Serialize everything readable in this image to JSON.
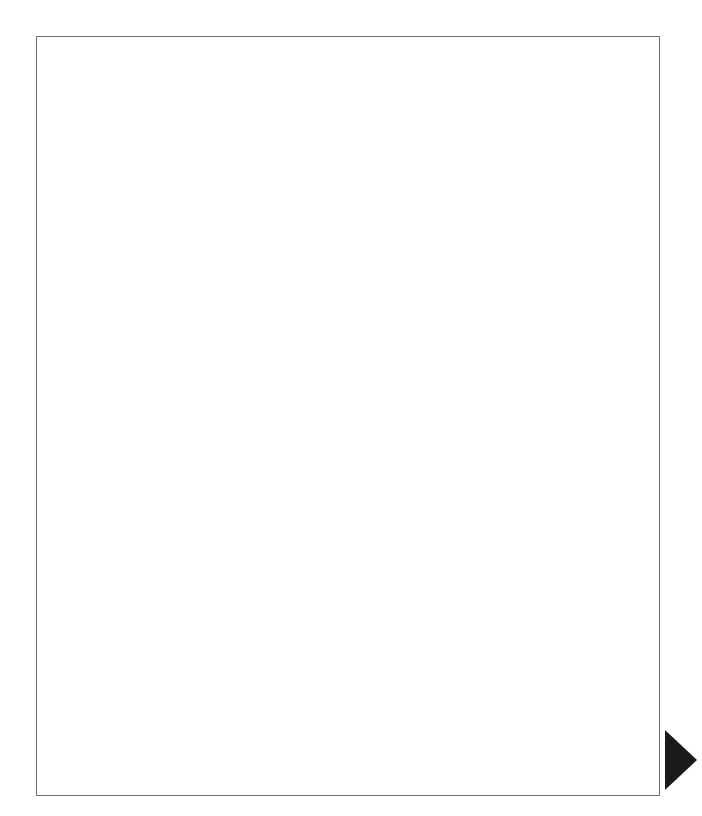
{
  "exhibit": {
    "title": "EXHIBIT 8.7    (Cont.)"
  },
  "page_marker": {
    "name": "page-turn-triangle",
    "color": "#1a1a1a"
  },
  "chart_data": {
    "type": "diagram",
    "diagram_type": "flowchart",
    "columns": [
      {
        "name": "load-product-table",
        "center_x": 298
      },
      {
        "name": "product-element-load",
        "center_x": 419
      },
      {
        "name": "load-months-table",
        "center_x": 598
      }
    ],
    "nodes": [
      {
        "id": "n1",
        "shape": "terminator",
        "lines": [
          "LOAD-",
          "PRODUCT-TABLE"
        ],
        "cx": 298,
        "cy": 90,
        "w": 102,
        "h": 44
      },
      {
        "id": "n2",
        "shape": "predefined-process",
        "lines": [
          "READ-",
          "PRODUCTS-",
          "TABLE-FILE"
        ],
        "cx": 298,
        "cy": 162,
        "w": 102,
        "h": 57
      },
      {
        "id": "n3",
        "shape": "preparation",
        "lines": [
          "SUB = 1"
        ],
        "cx": 298,
        "cy": 229,
        "w": 78,
        "h": 40
      },
      {
        "id": "n4",
        "shape": "decision",
        "lines": [
          "UNTIL",
          "SUB > 7"
        ],
        "cx": 298,
        "cy": 360,
        "w": 110,
        "h": 78
      },
      {
        "id": "n5",
        "shape": "connector-circle",
        "lines": [
          "SUB + 1"
        ],
        "cx": 75,
        "cy": 310,
        "w": 58,
        "h": 58
      },
      {
        "id": "n6",
        "shape": "predefined-process",
        "lines": [
          "PRODUCT-",
          "ELEMENT-LOAD"
        ],
        "cx": 172,
        "cy": 358,
        "w": 104,
        "h": 50
      },
      {
        "id": "n7",
        "shape": "terminator",
        "lines": [
          "RETURN"
        ],
        "cx": 298,
        "cy": 434,
        "w": 96,
        "h": 34
      },
      {
        "id": "n8",
        "shape": "terminator",
        "lines": [
          "LOAD-",
          "MONTHS-TABLE"
        ],
        "cx": 598,
        "cy": 90,
        "w": 104,
        "h": 44
      },
      {
        "id": "n9",
        "shape": "predefined-process",
        "lines": [
          "READ-",
          "MONTHS-",
          "TABLE-FILE"
        ],
        "cx": 598,
        "cy": 162,
        "w": 102,
        "h": 57
      },
      {
        "id": "n10",
        "shape": "preparation",
        "lines": [
          "SUB = 1"
        ],
        "cx": 598,
        "cy": 229,
        "w": 78,
        "h": 40
      },
      {
        "id": "n11",
        "shape": "decision",
        "lines": [
          "UNTIL",
          "SUB > 12"
        ],
        "cx": 598,
        "cy": 360,
        "w": 112,
        "h": 78
      },
      {
        "id": "n12",
        "shape": "connector-circle",
        "lines": [
          "SUB + 1"
        ],
        "cx": 375,
        "cy": 310,
        "w": 58,
        "h": 58
      },
      {
        "id": "n13",
        "shape": "predefined-process",
        "lines": [
          "MONTHS-",
          "ELEMENT-LOAD"
        ],
        "cx": 472,
        "cy": 358,
        "w": 104,
        "h": 50
      },
      {
        "id": "n14",
        "shape": "terminator",
        "lines": [
          "RETURN"
        ],
        "cx": 598,
        "cy": 434,
        "w": 96,
        "h": 34
      },
      {
        "id": "n15",
        "shape": "terminator",
        "lines": [
          "PRODUCT-",
          "ELEMENT-LOAD"
        ],
        "cx": 419,
        "cy": 432,
        "w": 102,
        "h": 40
      },
      {
        "id": "n16",
        "shape": "process",
        "lines": [
          "MOVE PRODUCT-",
          "NO-T TO",
          "PRODUCT-NO-",
          "TAB (SUB)"
        ],
        "cx": 419,
        "cy": 512,
        "w": 104,
        "h": 62
      },
      {
        "id": "n17",
        "shape": "process",
        "lines": [
          "MOVE PRODUCT-",
          "DESC-T TO",
          "PRODUCT-DESC-",
          "TAB (SUB)"
        ],
        "cx": 419,
        "cy": 577,
        "w": 104,
        "h": 62
      },
      {
        "id": "n18",
        "shape": "process",
        "lines": [
          "MOVE PRICE-T",
          "TO",
          "PRICE-TAB (SUB)"
        ],
        "cx": 419,
        "cy": 641,
        "w": 104,
        "h": 52
      },
      {
        "id": "n19",
        "shape": "predefined-process",
        "lines": [
          "READ-PRODUCTS-",
          "TABLE-FILE"
        ],
        "cx": 419,
        "cy": 711,
        "w": 104,
        "h": 50
      },
      {
        "id": "n20",
        "shape": "terminator",
        "lines": [
          "RETURN"
        ],
        "cx": 419,
        "cy": 765,
        "w": 96,
        "h": 34
      },
      {
        "id": "n21",
        "shape": "terminator",
        "lines": [
          "MONTHS-",
          "ELEMENT-LOAD"
        ],
        "cx": 574,
        "cy": 568,
        "w": 102,
        "h": 40
      },
      {
        "id": "n22",
        "shape": "process",
        "lines": [
          "STORE MONTH",
          "AT MONTH-TAB",
          "(SUB)"
        ],
        "cx": 574,
        "cy": 641,
        "w": 104,
        "h": 52
      },
      {
        "id": "n23",
        "shape": "predefined-process",
        "lines": [
          "READ-MONTHS-",
          "TABLE-FILE"
        ],
        "cx": 574,
        "cy": 711,
        "w": 104,
        "h": 50
      },
      {
        "id": "n24",
        "shape": "terminator",
        "lines": [
          "RETURN"
        ],
        "cx": 574,
        "cy": 765,
        "w": 96,
        "h": 34
      }
    ],
    "edge_labels": [
      {
        "id": "e-left-false",
        "text": "F",
        "x": 250,
        "y": 352
      },
      {
        "id": "e-left-true",
        "text": "T",
        "x": 308,
        "y": 411
      },
      {
        "id": "e-right-false",
        "text": "F",
        "x": 550,
        "y": 352
      },
      {
        "id": "e-right-true",
        "text": "T",
        "x": 608,
        "y": 411
      }
    ],
    "flows": [
      "LOAD-PRODUCT-TABLE -> READ-PRODUCTS-TABLE-FILE -> SUB = 1 -> UNTIL SUB > 7",
      "UNTIL SUB > 7 (F) -> PRODUCT-ELEMENT-LOAD -> SUB + 1 -> back to SUB = 1 path",
      "UNTIL SUB > 7 (T) -> RETURN",
      "LOAD-MONTHS-TABLE -> READ-MONTHS-TABLE-FILE -> SUB = 1 -> UNTIL SUB > 12",
      "UNTIL SUB > 12 (F) -> MONTHS-ELEMENT-LOAD -> SUB + 1 -> back to SUB = 1 path",
      "UNTIL SUB > 12 (T) -> RETURN",
      "PRODUCT-ELEMENT-LOAD -> MOVE PRODUCT-NO-T -> MOVE PRODUCT-DESC-T -> MOVE PRICE-T -> READ-PRODUCTS-TABLE-FILE -> RETURN",
      "MONTHS-ELEMENT-LOAD -> STORE MONTH AT MONTH-TAB (SUB) -> READ-MONTHS-TABLE-FILE -> RETURN"
    ]
  }
}
